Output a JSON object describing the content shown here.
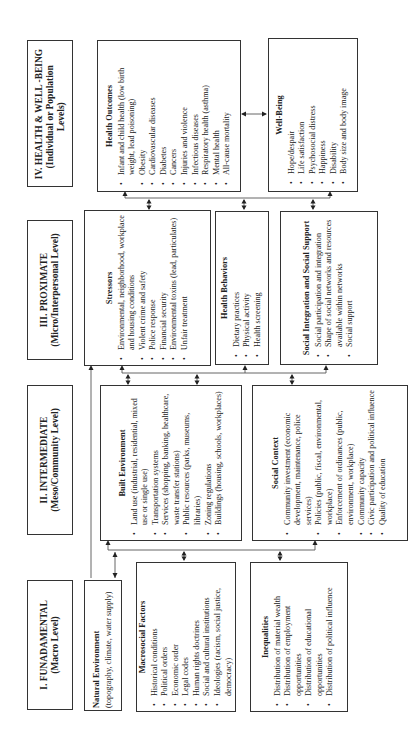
{
  "levels": [
    {
      "title": "IV. HEALTH & WELL -BEING",
      "subtitle": "(Individual or Population Levels)"
    },
    {
      "title": "III. PROXIMATE",
      "subtitle": "(Micro/Interpersonal Level)"
    },
    {
      "title": "II. INTERMEDIATE",
      "subtitle": "(Meso/Community Level)"
    },
    {
      "title": "I.  FUNADAMENTAL",
      "subtitle": "(Macro Level)"
    }
  ],
  "fundamental": {
    "natural_environment": {
      "title": "Natural Environment",
      "text": "(topography, climate, water supply)"
    },
    "macrosocial_factors": {
      "title": "Macrosocial Factors",
      "items": [
        "Historical conditions",
        "Political orders",
        "Economic order",
        "Legal codes",
        "Human rights doctrines",
        "Social and cultural institutions",
        "Ideologies (racism, social justice, democracy)"
      ]
    },
    "inequalities": {
      "title": "Inequalities",
      "items": [
        "Distribution of material wealth",
        "Distribution of employment opportunities",
        "Distribution of educational opportunities",
        "Distribution of political influence"
      ]
    }
  },
  "intermediate": {
    "built_environment": {
      "title": "Built Environment",
      "items": [
        "Land use (industrial, residential, mixed use or single use)",
        "Transportation systems",
        "Services (shopping, banking, healthcare, waste transfer stations)",
        "Public resources (parks, museums, libraries)",
        "Zoning regulations",
        "Buildings (housing, schools, workplaces)"
      ]
    },
    "social_context": {
      "title": "Social Context",
      "items": [
        "Community investment (economic development, maintenance, police services)",
        "Policies (public, fiscal, environmental, workplace)",
        "Enforcement of ordinances (public, environment, workplace)",
        "Community capacity",
        "Civic participation and political influence",
        "Quality of education"
      ]
    }
  },
  "proximate": {
    "stressors": {
      "title": "Stressors",
      "items": [
        "Environmental, neighborhood, workplace and housing conditions",
        "Violent crime and safety",
        "Police response",
        "Financial security",
        "Environmental toxins (lead, particulates)",
        "Unfair treatment"
      ]
    },
    "health_behaviors": {
      "title": "Health Behaviors",
      "items": [
        "Dietary practices",
        "Physical activity",
        "Health screening"
      ]
    },
    "social_integration": {
      "title": "Social Integration and Social Support",
      "items": [
        "Social participation and integration",
        "Shape of social networks and resources available within networks",
        "Social support"
      ]
    }
  },
  "outcomes": {
    "health_outcomes": {
      "title": "Health Outcomes",
      "items": [
        "Infant and child health (low birth weight, lead poisoning)",
        "Obesity",
        "Cardiovascular diseases",
        "Diabetes",
        "Cancers",
        "Injuries and violence",
        "Infectious diseases",
        "Respiratory health (asthma)",
        "Mental health",
        "All-cause mortality"
      ]
    },
    "well_being": {
      "title": "Well-Being",
      "items": [
        "Hope/despair",
        "Life satisfaction",
        "Psychosocial distress",
        "Happiness",
        "Disability",
        "Body size and body image"
      ]
    }
  }
}
